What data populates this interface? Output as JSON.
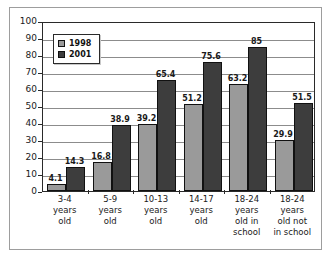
{
  "chart_data": {
    "type": "bar",
    "title": "",
    "subtitle": "",
    "xlabel": "",
    "ylabel": "",
    "ylim": [
      0,
      100
    ],
    "yticks": [
      0,
      10,
      20,
      30,
      40,
      50,
      60,
      70,
      80,
      90,
      100
    ],
    "grid": true,
    "legend_position": "top-left",
    "categories": [
      "3-4 years old",
      "5-9 years old",
      "10-13 years old",
      "14-17 years old",
      "18-24 years old in school",
      "18-24 years old not in school"
    ],
    "category_lines": [
      [
        "3-4",
        "years",
        "old"
      ],
      [
        "5-9",
        "years",
        "old"
      ],
      [
        "10-13",
        "years",
        "old"
      ],
      [
        "14-17",
        "years",
        "old"
      ],
      [
        "18-24",
        "years",
        "old in",
        "school"
      ],
      [
        "18-24",
        "years",
        "old not",
        "in school"
      ]
    ],
    "series": [
      {
        "name": "1998",
        "color": "#9a9a9a",
        "values": [
          4.1,
          16.8,
          39.2,
          51.2,
          63.2,
          29.9
        ],
        "labels": [
          "4.1",
          "16.8",
          "39.2",
          "51.2",
          "63.2",
          "29.9"
        ]
      },
      {
        "name": "2001",
        "color": "#3d3d3d",
        "values": [
          14.3,
          38.9,
          65.4,
          75.6,
          85,
          51.5
        ],
        "labels": [
          "14.3",
          "38.9",
          "65.4",
          "75.6",
          "85",
          "51.5"
        ]
      }
    ]
  },
  "legend": {
    "entries": [
      {
        "label": "1998",
        "swatch": "#9a9a9a"
      },
      {
        "label": "2001",
        "swatch": "#3d3d3d"
      }
    ]
  },
  "axis": {
    "y_tick_labels": [
      "100",
      "90",
      "80",
      "70",
      "60",
      "50",
      "40",
      "30",
      "20",
      "10",
      "0"
    ]
  },
  "colors": {
    "series_1998": "#9a9a9a",
    "series_2001": "#3d3d3d",
    "gridline": "#8c8c8c",
    "axis": "#2a2a2a",
    "frame": "#9d9d9d",
    "background": "#ffffff",
    "text": "#1a1a1a"
  }
}
